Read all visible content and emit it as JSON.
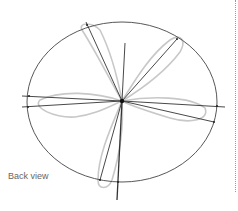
{
  "figure": {
    "caption": "Back view",
    "colors": {
      "ellipse": "#444444",
      "guide_lines": "#333333",
      "petals": "#c8c8c8",
      "caption": "#666666",
      "divider": "#9a9a9a"
    },
    "ellipse": {
      "cx": 122,
      "cy": 102,
      "rx": 95,
      "ry": 80
    },
    "center_point": {
      "x": 122,
      "y": 101
    },
    "guide_lines": [
      {
        "x1": 22,
        "y1": 96,
        "x2": 122,
        "y2": 101
      },
      {
        "x1": 22,
        "y1": 107,
        "x2": 122,
        "y2": 101
      },
      {
        "x1": 122,
        "y1": 101,
        "x2": 225,
        "y2": 107
      },
      {
        "x1": 122,
        "y1": 101,
        "x2": 214,
        "y2": 122
      },
      {
        "x1": 86,
        "y1": 22,
        "x2": 122,
        "y2": 101
      },
      {
        "x1": 177,
        "y1": 39,
        "x2": 122,
        "y2": 101
      },
      {
        "x1": 125,
        "y1": 43,
        "x2": 122,
        "y2": 101
      },
      {
        "x1": 122,
        "y1": 101,
        "x2": 117,
        "y2": 200
      },
      {
        "x1": 122,
        "y1": 101,
        "x2": 100,
        "y2": 180
      }
    ],
    "petal_count": 5
  }
}
